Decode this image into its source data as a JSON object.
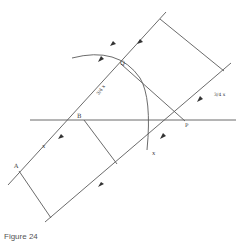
{
  "figure": {
    "caption": "Figure 24",
    "stroke_color": "#555555",
    "points": {
      "A": "A",
      "B": "B",
      "Q": "Q",
      "P": "P"
    },
    "segment_labels": {
      "AB": "x",
      "BQ": "3/4 x",
      "lower_x": "x",
      "right_frac": "3/4 x"
    }
  }
}
